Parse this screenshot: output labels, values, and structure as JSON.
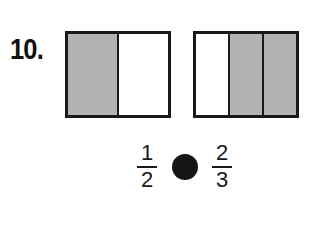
{
  "problem": {
    "number": "10.",
    "models": [
      {
        "name": "left-model",
        "parts": [
          {
            "shaded": true
          },
          {
            "shaded": false
          }
        ]
      },
      {
        "name": "right-model",
        "parts": [
          {
            "shaded": false
          },
          {
            "shaded": true
          },
          {
            "shaded": true
          }
        ]
      }
    ],
    "comparison": {
      "left_fraction": {
        "numerator": "1",
        "denominator": "2"
      },
      "right_fraction": {
        "numerator": "2",
        "denominator": "3"
      },
      "answer_circle": "filled-circle-icon"
    }
  },
  "colors": {
    "shaded": "#b3b3b3",
    "border": "#1a1a1a",
    "circle": "#151515"
  }
}
